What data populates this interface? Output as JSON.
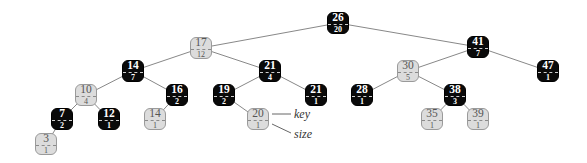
{
  "diagram": {
    "type": "red-black BST with subtree sizes",
    "colors": {
      "black": "#0a0a0a",
      "gray": "#dcdcdc",
      "edge": "#888888"
    },
    "legend": {
      "key_label": "key",
      "size_label": "size"
    },
    "nodes": [
      {
        "id": "n26",
        "key": "26",
        "size": "20",
        "color": "black",
        "x": 338,
        "y": 23
      },
      {
        "id": "n17",
        "key": "17",
        "size": "12",
        "color": "gray",
        "x": 201,
        "y": 48
      },
      {
        "id": "n41",
        "key": "41",
        "size": "7",
        "color": "black",
        "x": 478,
        "y": 47
      },
      {
        "id": "n14",
        "key": "14",
        "size": "7",
        "color": "black",
        "x": 133,
        "y": 71
      },
      {
        "id": "n21a",
        "key": "21",
        "size": "4",
        "color": "black",
        "x": 270,
        "y": 71
      },
      {
        "id": "n30",
        "key": "30",
        "size": "5",
        "color": "gray",
        "x": 408,
        "y": 71
      },
      {
        "id": "n47",
        "key": "47",
        "size": "1",
        "color": "black",
        "x": 548,
        "y": 71
      },
      {
        "id": "n10",
        "key": "10",
        "size": "4",
        "color": "gray",
        "x": 86,
        "y": 95
      },
      {
        "id": "n16",
        "key": "16",
        "size": "2",
        "color": "black",
        "x": 177,
        "y": 95
      },
      {
        "id": "n19",
        "key": "19",
        "size": "2",
        "color": "black",
        "x": 224,
        "y": 95
      },
      {
        "id": "n21b",
        "key": "21",
        "size": "1",
        "color": "black",
        "x": 316,
        "y": 95
      },
      {
        "id": "n28",
        "key": "28",
        "size": "1",
        "color": "black",
        "x": 362,
        "y": 95
      },
      {
        "id": "n38",
        "key": "38",
        "size": "3",
        "color": "black",
        "x": 455,
        "y": 95
      },
      {
        "id": "n7",
        "key": "7",
        "size": "2",
        "color": "black",
        "x": 62,
        "y": 119
      },
      {
        "id": "n12",
        "key": "12",
        "size": "1",
        "color": "black",
        "x": 109,
        "y": 119
      },
      {
        "id": "n14b",
        "key": "14",
        "size": "1",
        "color": "gray",
        "x": 155,
        "y": 119
      },
      {
        "id": "n20",
        "key": "20",
        "size": "1",
        "color": "gray",
        "x": 258,
        "y": 119
      },
      {
        "id": "n35",
        "key": "35",
        "size": "1",
        "color": "gray",
        "x": 432,
        "y": 119
      },
      {
        "id": "n39",
        "key": "39",
        "size": "1",
        "color": "gray",
        "x": 478,
        "y": 119
      },
      {
        "id": "n3",
        "key": "3",
        "size": "1",
        "color": "gray",
        "x": 46,
        "y": 144
      }
    ],
    "edges": [
      [
        "n26",
        "n17"
      ],
      [
        "n26",
        "n41"
      ],
      [
        "n17",
        "n14"
      ],
      [
        "n17",
        "n21a"
      ],
      [
        "n41",
        "n30"
      ],
      [
        "n41",
        "n47"
      ],
      [
        "n14",
        "n10"
      ],
      [
        "n14",
        "n16"
      ],
      [
        "n21a",
        "n19"
      ],
      [
        "n21a",
        "n21b"
      ],
      [
        "n30",
        "n28"
      ],
      [
        "n30",
        "n38"
      ],
      [
        "n10",
        "n7"
      ],
      [
        "n10",
        "n12"
      ],
      [
        "n16",
        "n14b"
      ],
      [
        "n19",
        "n20"
      ],
      [
        "n38",
        "n35"
      ],
      [
        "n38",
        "n39"
      ],
      [
        "n7",
        "n3"
      ]
    ],
    "annotations": [
      {
        "text_ref": "key",
        "from": [
          272,
          114
        ],
        "to": [
          291,
          114
        ],
        "label_x": 294,
        "label_y": 107
      },
      {
        "text_ref": "size",
        "from": [
          272,
          124
        ],
        "to": [
          291,
          133
        ],
        "label_x": 294,
        "label_y": 127
      }
    ]
  }
}
